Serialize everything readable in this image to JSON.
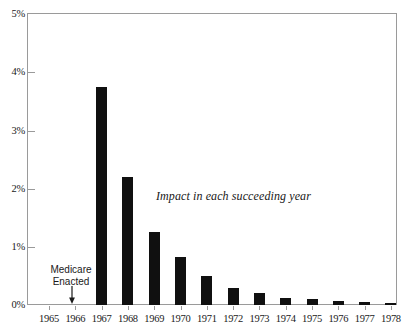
{
  "chart_data": {
    "type": "bar",
    "title": "",
    "subtitle": "",
    "xlabel": "",
    "ylabel": "",
    "categories": [
      "1965",
      "1966",
      "1967",
      "1968",
      "1969",
      "1970",
      "1971",
      "1972",
      "1973",
      "1974",
      "1975",
      "1976",
      "1977",
      "1978"
    ],
    "values": [
      0,
      0,
      3.75,
      2.2,
      1.25,
      0.82,
      0.5,
      0.3,
      0.2,
      0.12,
      0.1,
      0.07,
      0.05,
      0.04
    ],
    "ylim": [
      0,
      5
    ],
    "xlim_categories": [
      "1965",
      "1978"
    ],
    "ytick_labels": [
      "0%",
      "1%",
      "2%",
      "3%",
      "4%",
      "5%"
    ],
    "ytick_values": [
      0,
      1,
      2,
      3,
      4,
      5
    ],
    "grid": false,
    "legend": null,
    "legend_position": "none",
    "bar_color": "#101010",
    "frame_color": "#9a9a9a",
    "background": "#ffffff",
    "annotations": [
      {
        "id": "impact-note",
        "text": "Impact in each succeeding year",
        "style": "italic-serif"
      },
      {
        "id": "medicare-note",
        "line1": "Medicare",
        "line2": "Enacted",
        "text": "Medicare Enacted",
        "points_to_category": "1965",
        "marker": "down-arrow"
      }
    ]
  }
}
